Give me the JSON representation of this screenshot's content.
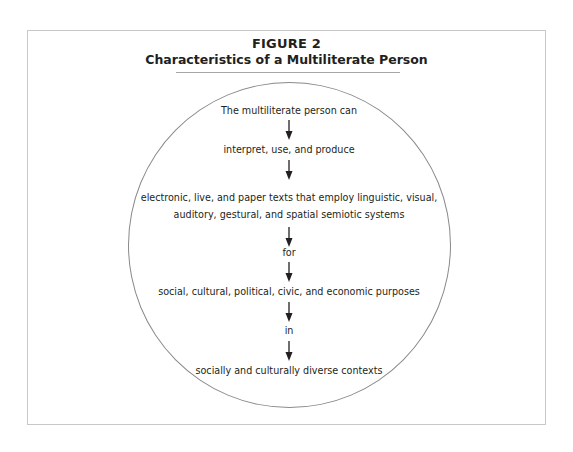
{
  "figure": {
    "label": "FIGURE 2",
    "title": "Characteristics of a Multiliterate Person"
  },
  "flow": {
    "steps": [
      {
        "text": "The multiliterate person can"
      },
      {
        "text": "interpret, use, and produce"
      },
      {
        "text": "electronic, live, and paper texts that employ linguistic, visual,",
        "text2": "auditory, gestural, and spatial semiotic systems"
      },
      {
        "text": "for"
      },
      {
        "text": "social, cultural, political, civic, and economic purposes"
      },
      {
        "text": "in"
      },
      {
        "text": "socially and culturally diverse contexts"
      }
    ],
    "connector": "down-arrow",
    "container_shape": "circle"
  },
  "colors": {
    "text": "#231f20",
    "frame_border": "#c8c8c8",
    "title_rule": "#a6a6a6",
    "circle_stroke": "#8a8a8a"
  }
}
